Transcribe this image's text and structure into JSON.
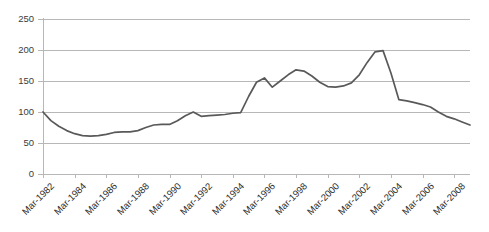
{
  "chart_data": {
    "type": "line",
    "title": "",
    "subtitle": "",
    "xlabel": "",
    "ylabel": "",
    "ylim": [
      0,
      250
    ],
    "y_ticks": [
      0,
      50,
      100,
      150,
      200,
      250
    ],
    "grid": true,
    "legend": false,
    "legend_position": "none",
    "line_color": "#595959",
    "grid_color": "#b7b7b7",
    "background_color": "#ffffff",
    "x_tick_labels": [
      "Mar-1982",
      "Mar-1984",
      "Mar-1986",
      "Mar-1988",
      "Mar-1990",
      "Mar-1992",
      "Mar-1994",
      "Mar-1996",
      "Mar-1998",
      "Mar-2000",
      "Mar-2002",
      "Mar-2004",
      "Mar-2006",
      "Mar-2008"
    ],
    "x_tick_interval_years": 2,
    "x": [
      "Mar-1982",
      "Mar-1983",
      "Mar-1984",
      "Mar-1985",
      "Mar-1986",
      "Mar-1987",
      "Mar-1988",
      "Mar-1989",
      "Mar-1990",
      "Mar-1991",
      "Mar-1992",
      "Mar-1993",
      "Mar-1994",
      "Mar-1995",
      "Mar-1996",
      "Mar-1997",
      "Mar-1998",
      "Mar-1999",
      "Mar-2000",
      "Mar-2001",
      "Mar-2002",
      "Mar-2003",
      "Mar-2004",
      "Mar-2005",
      "Mar-2006",
      "Mar-2007",
      "Mar-2008",
      "Mar-2009"
    ],
    "series": [
      {
        "name": "Index",
        "values": [
          100,
          77,
          65,
          61,
          63,
          68,
          69,
          76,
          80,
          80,
          88,
          99,
          93,
          95,
          97,
          99,
          110,
          137,
          155,
          140,
          155,
          168,
          161,
          147,
          141,
          142,
          148,
          165
        ]
      }
    ],
    "values_note": "annual points plotted between Mar-1982 and Mar-2009"
  },
  "chart_points": {
    "x_values": [
      1982.0,
      1982.5,
      1983.0,
      1983.5,
      1984.0,
      1984.5,
      1985.0,
      1985.5,
      1986.0,
      1986.5,
      1987.0,
      1987.5,
      1988.0,
      1988.5,
      1989.0,
      1989.5,
      1990.0,
      1990.5,
      1991.0,
      1991.5,
      1992.0,
      1992.5,
      1993.0,
      1993.5,
      1994.0,
      1994.5,
      1995.0,
      1995.5,
      1996.0,
      1996.5,
      1997.0,
      1997.5,
      1998.0,
      1998.5,
      1999.0,
      1999.5,
      2000.0,
      2000.5,
      2001.0,
      2001.5,
      2002.0,
      2002.5,
      2003.0,
      2003.5,
      2004.0,
      2004.5,
      2005.0,
      2005.5,
      2006.0,
      2006.5,
      2007.0,
      2007.5,
      2008.0,
      2008.5,
      2009.0
    ],
    "y_values": [
      100,
      86,
      77,
      70,
      65,
      62,
      61,
      62,
      64,
      67,
      68,
      68,
      70,
      75,
      79,
      80,
      80,
      86,
      94,
      100,
      93,
      94,
      95,
      96,
      98,
      99,
      125,
      148,
      155,
      140,
      150,
      160,
      168,
      166,
      158,
      148,
      141,
      140,
      142,
      147,
      160,
      180,
      197,
      199,
      163,
      120,
      118,
      115,
      112,
      108,
      100,
      93,
      89,
      84,
      79
    ]
  },
  "axis": {
    "y_tick_labels": [
      "250",
      "200",
      "150",
      "100",
      "50",
      "0"
    ]
  }
}
